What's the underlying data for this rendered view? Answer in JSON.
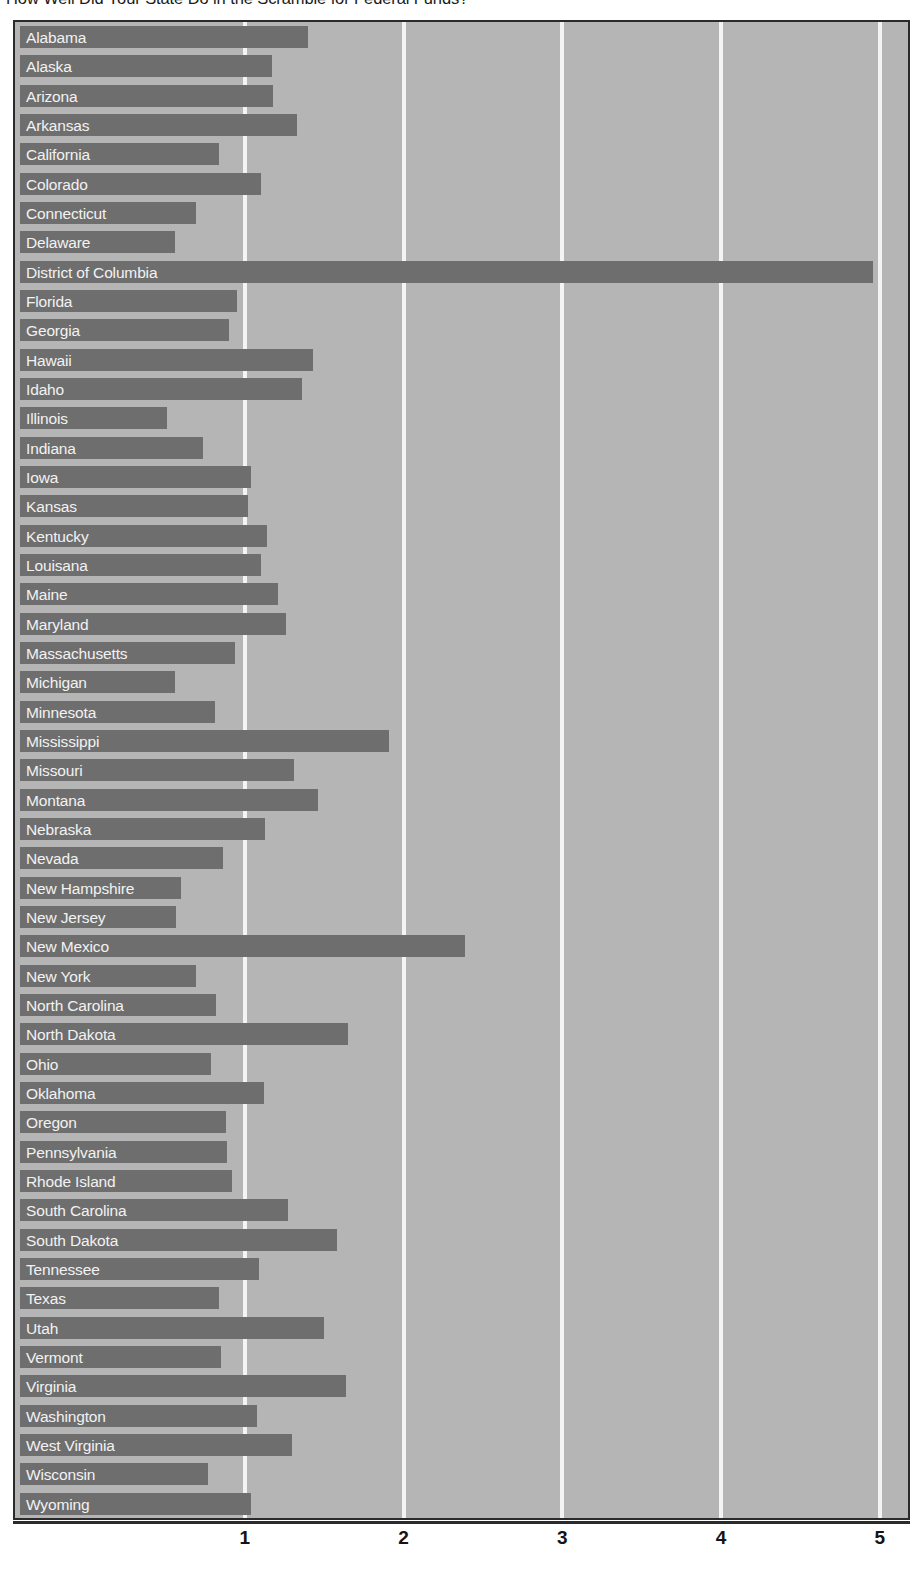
{
  "chart_data": {
    "type": "bar",
    "orientation": "horizontal",
    "title": "How Well Did Your State Do in the Scramble for Federal Funds?",
    "xlabel": "",
    "ylabel": "",
    "xlim": [
      0,
      5.25
    ],
    "xticks": [
      1,
      2,
      3,
      4,
      5
    ],
    "xtick_labels": [
      "1",
      "2",
      "3",
      "4",
      "5"
    ],
    "grid": true,
    "grid_axis": "x",
    "legend": false,
    "bar_color": "#6e6e6e",
    "plot_background": "#b5b5b5",
    "gridline_color": "#f4f4f4",
    "label_color": "#f2f2f2",
    "categories": [
      "Alabama",
      "Alaska",
      "Arizona",
      "Arkansas",
      "California",
      "Colorado",
      "Connecticut",
      "Delaware",
      "District of Columbia",
      "Florida",
      "Georgia",
      "Hawaii",
      "Idaho",
      "Illinois",
      "Indiana",
      "Iowa",
      "Kansas",
      "Kentucky",
      "Louisana",
      "Maine",
      "Maryland",
      "Massachusetts",
      "Michigan",
      "Minnesota",
      "Mississippi",
      "Missouri",
      "Montana",
      "Nebraska",
      "Nevada",
      "New Hampshire",
      "New Jersey",
      "New Mexico",
      "New York",
      "North Carolina",
      "North Dakota",
      "Ohio",
      "Oklahoma",
      "Oregon",
      "Pennsylvania",
      "Rhode Island",
      "South Carolina",
      "South Dakota",
      "Tennessee",
      "Texas",
      "Utah",
      "Vermont",
      "Virginia",
      "Washington",
      "West Virginia",
      "Wisconsin",
      "Wyoming"
    ],
    "values": [
      1.4,
      1.17,
      1.18,
      1.33,
      0.84,
      1.1,
      0.69,
      0.56,
      4.96,
      0.95,
      0.9,
      1.43,
      1.36,
      0.51,
      0.74,
      1.04,
      1.02,
      1.14,
      1.1,
      1.21,
      1.26,
      0.94,
      0.56,
      0.81,
      1.91,
      1.31,
      1.46,
      1.13,
      0.86,
      0.6,
      0.57,
      2.39,
      0.69,
      0.82,
      1.65,
      0.79,
      1.12,
      0.88,
      0.89,
      0.92,
      1.27,
      1.58,
      1.09,
      0.84,
      1.5,
      0.85,
      1.64,
      1.08,
      1.3,
      0.77,
      1.04
    ]
  }
}
